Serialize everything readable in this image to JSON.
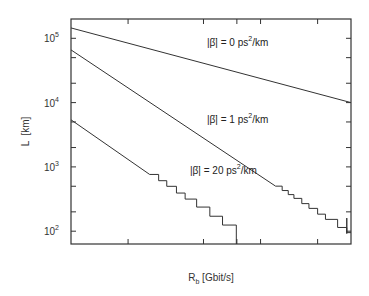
{
  "chart_data": {
    "type": "line",
    "title": "",
    "xlabel": "R_b [Gbit/s]",
    "xlabel_main": "R",
    "xlabel_sub": "b",
    "xlabel_rest": " [Gbit/s]",
    "ylabel": "L  [km]",
    "xscale": "log",
    "yscale": "log",
    "xlim": [
      1,
      30
    ],
    "ylim": [
      60,
      200000
    ],
    "grid": false,
    "legend": "none (inline annotations)",
    "x_ticks": [
      1,
      2,
      5,
      10,
      20,
      30
    ],
    "x_tick_labels": [
      "1",
      "2",
      "5",
      "10",
      "20",
      "30"
    ],
    "y_ticks": [
      100,
      1000,
      10000,
      100000
    ],
    "y_tick_labels": [
      {
        "base": "10",
        "exp": "2"
      },
      {
        "base": "10",
        "exp": "3"
      },
      {
        "base": "10",
        "exp": "4"
      },
      {
        "base": "10",
        "exp": "5"
      }
    ],
    "series": [
      {
        "name": "|β̈| = 0 ps²/km",
        "label_pre": "|β̈| =  0 ps",
        "label_sup": "2",
        "label_post": "/km",
        "x": [
          1,
          30
        ],
        "y": [
          145000,
          10000
        ]
      },
      {
        "name": "|β̈| = 1 ps²/km",
        "label_pre": "|β̈| =  1 ps",
        "label_sup": "2",
        "label_post": "/km",
        "x": [
          1,
          2,
          5,
          10,
          12,
          15,
          20,
          25,
          30
        ],
        "y": [
          66000,
          17000,
          2800,
          720,
          500,
          330,
          190,
          160,
          95
        ],
        "note": "staircase behaviour above ~12 Gbit/s"
      },
      {
        "name": "|β̈| = 20 ps²/km",
        "label_pre": "|β̈| = 20 ps",
        "label_sup": "2",
        "label_post": "/km",
        "x": [
          1,
          2,
          3,
          4,
          5,
          6,
          7,
          7.5
        ],
        "y": [
          5400,
          1350,
          560,
          320,
          200,
          150,
          120,
          60
        ],
        "note": "staircase behaviour above ~3 Gbit/s; drops off below 10^2 at ~7.5 Gbit/s"
      }
    ]
  }
}
